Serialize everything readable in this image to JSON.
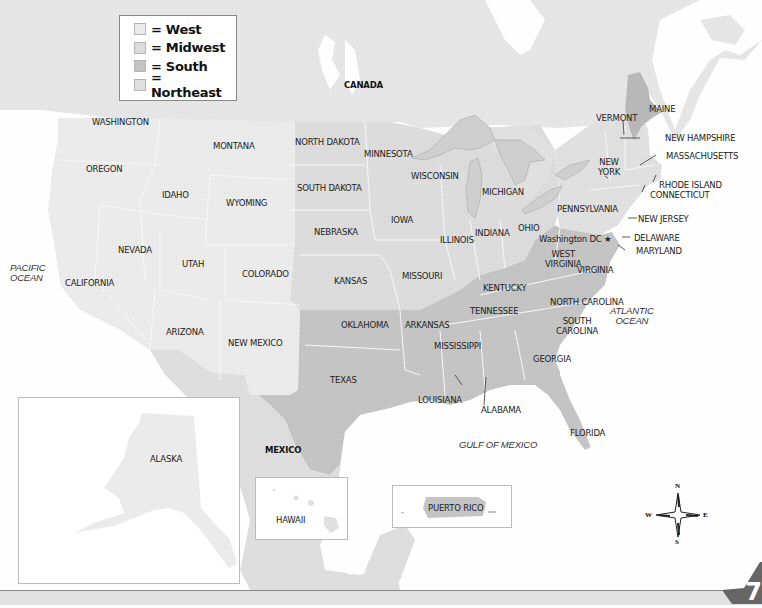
{
  "legend": {
    "items": [
      {
        "label": "= West",
        "region": "west",
        "color": "#ebebeb"
      },
      {
        "label": "= Midwest",
        "region": "midwest",
        "color": "#dcdcdc"
      },
      {
        "label": "= South",
        "region": "south",
        "color": "#c4c4c4"
      },
      {
        "label": "= Northeast",
        "region": "northeast",
        "color": "#e0e0e0"
      }
    ]
  },
  "colors": {
    "background": "#ffffff",
    "canada": "#e6e6e6",
    "west": "#ebebeb",
    "midwest": "#dcdcdc",
    "south": "#c4c4c4",
    "northeast": "#e0e0e0",
    "maine": "#b8b8b8",
    "lakes": "#cfcfcf",
    "mexico": "#dedede",
    "state_border": "#f6f6f6"
  },
  "labels": {
    "countries": {
      "canada": "CANADA",
      "mexico": "MEXICO"
    },
    "oceans": {
      "pacific": "PACIFIC\nOCEAN",
      "pacific_line1": "PACIFIC",
      "pacific_line2": "OCEAN",
      "atlantic_line1": "ATLANTIC",
      "atlantic_line2": "OCEAN",
      "gulf": "GULF OF MEXICO"
    },
    "states": {
      "washington": "WASHINGTON",
      "oregon": "OREGON",
      "california": "CALIFORNIA",
      "nevada": "NEVADA",
      "idaho": "IDAHO",
      "montana": "MONTANA",
      "wyoming": "WYOMING",
      "utah": "UTAH",
      "colorado": "COLORADO",
      "arizona": "ARIZONA",
      "new_mexico": "NEW MEXICO",
      "north_dakota": "NORTH DAKOTA",
      "south_dakota": "SOUTH DAKOTA",
      "nebraska": "NEBRASKA",
      "kansas": "KANSAS",
      "minnesota": "MINNESOTA",
      "iowa": "IOWA",
      "missouri": "MISSOURI",
      "wisconsin": "WISCONSIN",
      "illinois": "ILLINOIS",
      "michigan": "MICHIGAN",
      "indiana": "INDIANA",
      "ohio": "OHIO",
      "texas": "TEXAS",
      "oklahoma": "OKLAHOMA",
      "arkansas": "ARKANSAS",
      "louisiana": "LOUISIANA",
      "mississippi": "MISSISSIPPI",
      "alabama": "ALABAMA",
      "tennessee": "TENNESSEE",
      "kentucky": "KENTUCKY",
      "georgia": "GEORGIA",
      "florida": "FLORIDA",
      "south_carolina_1": "SOUTH",
      "south_carolina_2": "CAROLINA",
      "north_carolina": "NORTH CAROLINA",
      "virginia": "VIRGINIA",
      "west_virginia_1": "WEST",
      "west_virginia_2": "VIRGINIA",
      "washington_dc": "Washington DC ★",
      "maryland": "MARYLAND",
      "delaware": "DELAWARE",
      "new_jersey": "NEW JERSEY",
      "pennsylvania": "PENNSYLVANIA",
      "new_york_1": "NEW",
      "new_york_2": "YORK",
      "connecticut": "CONNECTICUT",
      "rhode_island": "RHODE ISLAND",
      "massachusetts": "MASSACHUSETTS",
      "new_hampshire": "NEW HAMPSHIRE",
      "vermont": "VERMONT",
      "maine": "MAINE",
      "alaska": "ALASKA",
      "hawaii": "HAWAII",
      "puerto_rico": "PUERTO RICO"
    }
  },
  "compass": {
    "n": "N",
    "s": "S",
    "e": "E",
    "w": "W"
  },
  "page_corner": {
    "number": "7"
  }
}
